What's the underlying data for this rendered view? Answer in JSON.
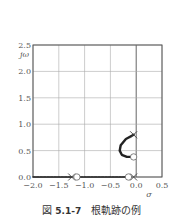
{
  "chart_data": {
    "type": "scatter",
    "title": "",
    "xlabel": "σ",
    "ylabel": "jω",
    "xlim": [
      -2.0,
      0.5
    ],
    "ylim": [
      0.0,
      2.5
    ],
    "xticks": [
      "−2.0",
      "−1.5",
      "−1.0",
      "−0.5",
      "0.0",
      "0.5"
    ],
    "yticks": [
      "0.0",
      "0.5",
      "1.0",
      "1.5",
      "2.0",
      "2.5"
    ],
    "grid": true,
    "poles": [
      {
        "x": -1.25,
        "y": 0.0
      },
      {
        "x": -0.05,
        "y": 0.0
      },
      {
        "x": -0.05,
        "y": 0.8
      }
    ],
    "zeros": [
      {
        "x": -1.15,
        "y": 0.0
      },
      {
        "x": -0.15,
        "y": 0.0
      },
      {
        "x": -0.05,
        "y": 0.38
      }
    ],
    "series": [
      {
        "name": "real-axis locus left",
        "points": [
          [
            -2.0,
            0
          ],
          [
            -1.25,
            0
          ]
        ]
      },
      {
        "name": "real-axis locus middle",
        "points": [
          [
            -1.15,
            0
          ],
          [
            -0.15,
            0
          ]
        ]
      },
      {
        "name": "complex branch",
        "points": [
          [
            -0.05,
            0.8
          ],
          [
            -0.2,
            0.72
          ],
          [
            -0.3,
            0.6
          ],
          [
            -0.32,
            0.5
          ],
          [
            -0.28,
            0.42
          ],
          [
            -0.18,
            0.38
          ],
          [
            -0.05,
            0.38
          ]
        ]
      }
    ]
  },
  "caption": {
    "prefix": "図",
    "number": "5.1-7",
    "text": "根軌跡の例"
  }
}
